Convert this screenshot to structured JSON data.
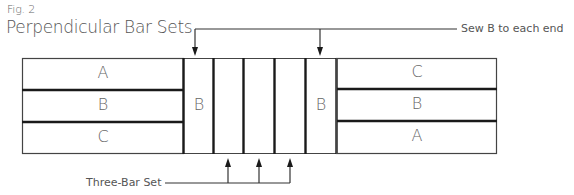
{
  "figure": {
    "number": "Fig. 2",
    "title": "Perpendicular Bar Sets"
  },
  "annotations": {
    "top": "Sew B to each end",
    "bottom": "Three-Bar Set"
  },
  "left_bar_set": {
    "rows": [
      "A",
      "B",
      "C"
    ]
  },
  "center_strips": {
    "left_end": "B",
    "right_end": "B",
    "middle_count": 3
  },
  "right_bar_set": {
    "rows": [
      "C",
      "B",
      "A"
    ]
  },
  "colors": {
    "line": "#1a1a1a",
    "text": "#555555",
    "background": "#ffffff"
  }
}
